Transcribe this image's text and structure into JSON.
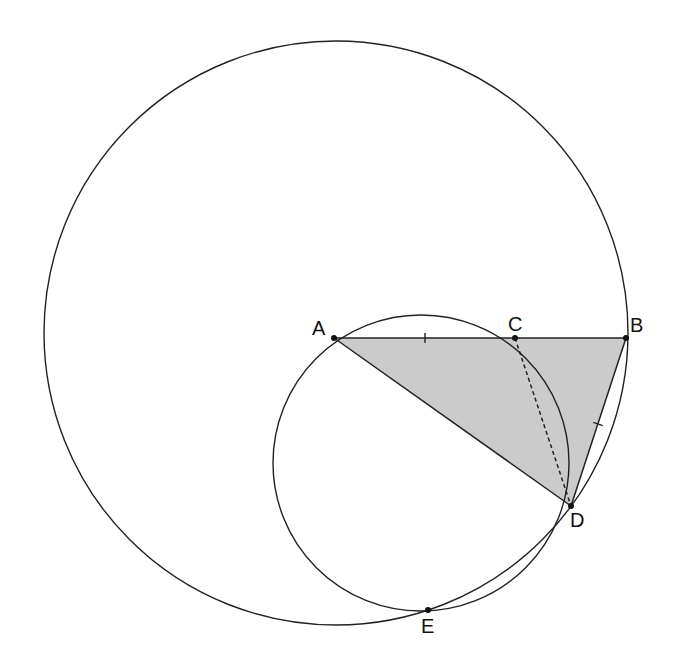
{
  "diagram": {
    "type": "geometry",
    "circles": [
      {
        "name": "large-circle",
        "cx": 336,
        "cy": 333,
        "r": 292
      },
      {
        "name": "small-circle",
        "cx": 421,
        "cy": 463,
        "r": 148
      }
    ],
    "points": [
      {
        "id": "A",
        "label": "A",
        "x": 334,
        "y": 338,
        "lx": 312,
        "ly": 318
      },
      {
        "id": "C",
        "label": "C",
        "x": 515,
        "y": 338,
        "lx": 508,
        "ly": 314
      },
      {
        "id": "B",
        "label": "B",
        "x": 626,
        "y": 338,
        "lx": 630,
        "ly": 315
      },
      {
        "id": "D",
        "label": "D",
        "x": 571,
        "y": 506,
        "lx": 570,
        "ly": 510
      },
      {
        "id": "E",
        "label": "E",
        "x": 428,
        "y": 610,
        "lx": 421,
        "ly": 616
      }
    ],
    "shaded_triangle": [
      "A",
      "B",
      "D"
    ],
    "shade_color": "#cbcbcb",
    "segments": [
      {
        "from": "A",
        "to": "B",
        "style": "solid"
      },
      {
        "from": "A",
        "to": "D",
        "style": "solid"
      },
      {
        "from": "B",
        "to": "D",
        "style": "solid"
      },
      {
        "from": "C",
        "to": "D",
        "style": "dashed"
      }
    ],
    "tick_marks": [
      {
        "segment": "AC",
        "x": 425,
        "y": 338
      },
      {
        "segment": "BD",
        "x": 598,
        "y": 424
      }
    ]
  }
}
